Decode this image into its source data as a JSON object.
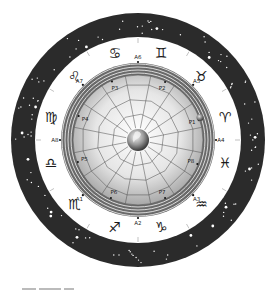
{
  "diagram": {
    "colors": {
      "outer_ring": "#2b2b2b",
      "star": "#ffffff",
      "zodiac_band": "#ffffff",
      "metal_band_light": "#e8e8e8",
      "metal_band_dark": "#6a6a6a",
      "disc_center": "#ffffff",
      "disc_edge": "#9a9a9a",
      "grid_line": "#4a4a4a",
      "text": "#222222"
    },
    "zodiac_signs": [
      {
        "name": "gemini",
        "glyph": "♊",
        "angle_deg": 75
      },
      {
        "name": "cancer",
        "glyph": "♋",
        "angle_deg": 105
      },
      {
        "name": "leo",
        "glyph": "♌",
        "angle_deg": 135
      },
      {
        "name": "virgo",
        "glyph": "♍",
        "angle_deg": 165
      },
      {
        "name": "libra",
        "glyph": "♎",
        "angle_deg": 195
      },
      {
        "name": "scorpio",
        "glyph": "♏",
        "angle_deg": 225
      },
      {
        "name": "sagittarius",
        "glyph": "♐",
        "angle_deg": 255
      },
      {
        "name": "capricorn",
        "glyph": "♑",
        "angle_deg": 285
      },
      {
        "name": "aquarius",
        "glyph": "♒",
        "angle_deg": 315
      },
      {
        "name": "pisces",
        "glyph": "♓",
        "angle_deg": 345
      },
      {
        "name": "aries",
        "glyph": "♈",
        "angle_deg": 15
      },
      {
        "name": "taurus",
        "glyph": "♉",
        "angle_deg": 45
      }
    ],
    "axis_markers": [
      {
        "label": "A1",
        "angle_deg": 225
      },
      {
        "label": "A2",
        "angle_deg": 270
      },
      {
        "label": "A3",
        "angle_deg": 315
      },
      {
        "label": "A4",
        "angle_deg": 0
      },
      {
        "label": "A5",
        "angle_deg": 45
      },
      {
        "label": "A6",
        "angle_deg": 90
      },
      {
        "label": "A7",
        "angle_deg": 135
      },
      {
        "label": "A8",
        "angle_deg": 180
      }
    ],
    "planet_markers": [
      {
        "label": "P1",
        "angle_deg": 18
      },
      {
        "label": "P2",
        "angle_deg": 65
      },
      {
        "label": "P3",
        "angle_deg": 114
      },
      {
        "label": "P4",
        "angle_deg": 158
      },
      {
        "label": "P5",
        "angle_deg": 200
      },
      {
        "label": "P6",
        "angle_deg": 245
      },
      {
        "label": "P7",
        "angle_deg": 295
      },
      {
        "label": "P8",
        "angle_deg": 338
      }
    ],
    "grid": {
      "spokes": 16,
      "rings": 3
    },
    "center_object": "globe"
  }
}
